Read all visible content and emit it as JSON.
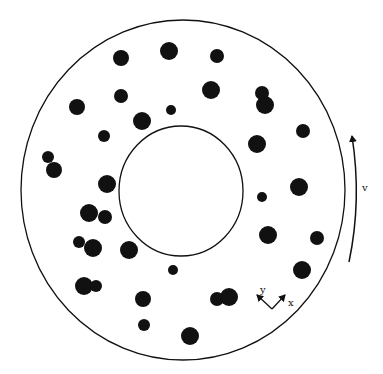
{
  "diagram": {
    "type": "annular-disk-with-particles",
    "outer_ring": {
      "cx": 183,
      "cy": 190,
      "rx": 162,
      "ry": 170
    },
    "inner_ring": {
      "cx": 181,
      "cy": 191,
      "rx": 62,
      "ry": 65
    },
    "particles": [
      {
        "x": 121,
        "y": 58,
        "r": 8
      },
      {
        "x": 169,
        "y": 51,
        "r": 9
      },
      {
        "x": 217,
        "y": 56,
        "r": 7
      },
      {
        "x": 121,
        "y": 96,
        "r": 7
      },
      {
        "x": 211,
        "y": 90,
        "r": 9
      },
      {
        "x": 262,
        "y": 93,
        "r": 7
      },
      {
        "x": 265,
        "y": 105,
        "r": 9
      },
      {
        "x": 77,
        "y": 107,
        "r": 8
      },
      {
        "x": 171,
        "y": 110,
        "r": 5
      },
      {
        "x": 142,
        "y": 121,
        "r": 9
      },
      {
        "x": 104,
        "y": 136,
        "r": 6
      },
      {
        "x": 257,
        "y": 144,
        "r": 9
      },
      {
        "x": 303,
        "y": 131,
        "r": 7
      },
      {
        "x": 48,
        "y": 157,
        "r": 6
      },
      {
        "x": 54,
        "y": 170,
        "r": 8
      },
      {
        "x": 107,
        "y": 184,
        "r": 9
      },
      {
        "x": 299,
        "y": 187,
        "r": 9
      },
      {
        "x": 262,
        "y": 197,
        "r": 5
      },
      {
        "x": 89,
        "y": 213,
        "r": 9
      },
      {
        "x": 105,
        "y": 217,
        "r": 7
      },
      {
        "x": 79,
        "y": 242,
        "r": 6
      },
      {
        "x": 93,
        "y": 248,
        "r": 9
      },
      {
        "x": 129,
        "y": 250,
        "r": 9
      },
      {
        "x": 268,
        "y": 235,
        "r": 9
      },
      {
        "x": 317,
        "y": 238,
        "r": 7
      },
      {
        "x": 173,
        "y": 270,
        "r": 5
      },
      {
        "x": 302,
        "y": 270,
        "r": 9
      },
      {
        "x": 84,
        "y": 286,
        "r": 9
      },
      {
        "x": 96,
        "y": 286,
        "r": 6
      },
      {
        "x": 143,
        "y": 299,
        "r": 8
      },
      {
        "x": 217,
        "y": 299,
        "r": 7
      },
      {
        "x": 229,
        "y": 297,
        "r": 9
      },
      {
        "x": 144,
        "y": 325,
        "r": 6
      },
      {
        "x": 190,
        "y": 336,
        "r": 9
      }
    ],
    "labels": {
      "velocity": "v",
      "axis_x": "x",
      "axis_y": "y"
    },
    "colors": {
      "ink": "#111111",
      "background": "#ffffff"
    }
  }
}
